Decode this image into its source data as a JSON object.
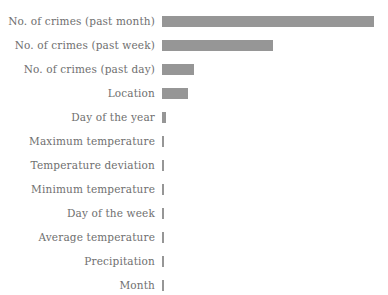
{
  "chart_data": {
    "type": "bar",
    "orientation": "horizontal",
    "title": "",
    "subtitle": "",
    "xlabel": "",
    "ylabel": "",
    "legend": [],
    "grid": false,
    "xlim": [
      0,
      1.0
    ],
    "bar_color": "#969696",
    "label_color": "#6f6f6f",
    "background_color": "#ffffff",
    "categories": [
      "No. of crimes (past month)",
      "No. of crimes (past week)",
      "No. of crimes (past day)",
      "Location",
      "Day of the year",
      "Maximum temperature",
      "Temperature deviation",
      "Minimum temperature",
      "Day of the week",
      "Average temperature",
      "Precipitation",
      "Month"
    ],
    "values": [
      1.0,
      0.524,
      0.151,
      0.123,
      0.019,
      0.0094,
      0.0094,
      0.0094,
      0.0094,
      0.0094,
      0.0071,
      0.0071
    ],
    "bar_pixel_lengths": [
      212,
      111,
      32,
      26,
      4,
      2,
      2,
      2,
      2,
      2,
      1.5,
      1.5
    ]
  },
  "bars": [
    {
      "label": "No. of crimes (past month)",
      "length_px": 212
    },
    {
      "label": "No. of crimes (past week)",
      "length_px": 111
    },
    {
      "label": "No. of crimes (past day)",
      "length_px": 32
    },
    {
      "label": "Location",
      "length_px": 26
    },
    {
      "label": "Day of the year",
      "length_px": 4
    },
    {
      "label": "Maximum temperature",
      "length_px": 2
    },
    {
      "label": "Temperature deviation",
      "length_px": 2
    },
    {
      "label": "Minimum temperature",
      "length_px": 2
    },
    {
      "label": "Day of the week",
      "length_px": 2
    },
    {
      "label": "Average temperature",
      "length_px": 2
    },
    {
      "label": "Precipitation",
      "length_px": 1.5
    },
    {
      "label": "Month",
      "length_px": 1.5
    }
  ]
}
